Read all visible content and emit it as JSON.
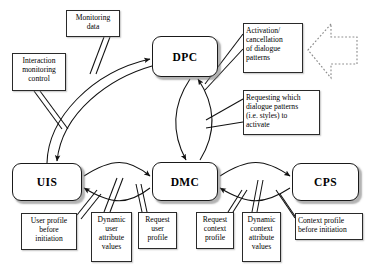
{
  "diagram": {
    "type": "block-diagram",
    "nodes": [
      {
        "id": "dpc",
        "label": "DPC",
        "x": 152,
        "y": 36,
        "w": 66,
        "h": 41
      },
      {
        "id": "uis",
        "label": "UIS",
        "x": 12,
        "y": 163,
        "w": 70,
        "h": 38
      },
      {
        "id": "dmc",
        "label": "DMC",
        "x": 152,
        "y": 162,
        "w": 66,
        "h": 39
      },
      {
        "id": "cps",
        "label": "CPS",
        "x": 292,
        "y": 163,
        "w": 67,
        "h": 38
      }
    ],
    "labels": [
      {
        "id": "monitoring-data",
        "text": "Monitoring\ndata",
        "x": 66,
        "y": 10,
        "w": 54,
        "h": 27,
        "align": "center"
      },
      {
        "id": "interaction-monitoring-control",
        "text": "Interaction\nmonitoring\ncontrol",
        "x": 12,
        "y": 53,
        "w": 54,
        "h": 38,
        "align": "center"
      },
      {
        "id": "activation-cancellation",
        "text": "Activation/\ncancellation\nof dialogue\npatterns",
        "x": 243,
        "y": 23,
        "w": 60,
        "h": 50,
        "align": "left"
      },
      {
        "id": "requesting-dialogue-patterns",
        "text": "Requesting which\ndialogue patterns\n(i.e. styles) to\nactivate",
        "x": 243,
        "y": 90,
        "w": 77,
        "h": 45,
        "align": "left"
      },
      {
        "id": "user-profile-before-initiation",
        "text": "User profile\nbefore\ninitiation",
        "x": 21,
        "y": 213,
        "w": 56,
        "h": 37,
        "align": "center"
      },
      {
        "id": "dynamic-user-attribute-values",
        "text": "Dynamic\nuser\nattribute\nvalues",
        "x": 91,
        "y": 212,
        "w": 41,
        "h": 50,
        "align": "center"
      },
      {
        "id": "request-user-profile",
        "text": "Request\nuser\nprofile",
        "x": 138,
        "y": 212,
        "w": 39,
        "h": 37,
        "align": "center"
      },
      {
        "id": "request-context-profile",
        "text": "Request\ncontext\nprofile",
        "x": 196,
        "y": 212,
        "w": 38,
        "h": 37,
        "align": "center"
      },
      {
        "id": "dynamic-context-attribute-values",
        "text": "Dynamic\ncontext\nattribute\nvalues",
        "x": 242,
        "y": 212,
        "w": 39,
        "h": 50,
        "align": "center"
      },
      {
        "id": "context-profile-before-initiation",
        "text": "Context profile\nbefore initiation",
        "x": 295,
        "y": 213,
        "w": 68,
        "h": 27,
        "align": "left"
      }
    ],
    "decorations": [
      {
        "id": "dotted-block-arrow",
        "shape": "left-pointing-block-arrow",
        "style": "dotted",
        "x": 305,
        "y": 22,
        "w": 55,
        "h": 58
      }
    ],
    "colors": {
      "stroke": "#1a1a1a",
      "background": "#ffffff",
      "text": "#000000",
      "shadow": "#8a8a8a",
      "dotted": "#8d8d8d"
    }
  }
}
